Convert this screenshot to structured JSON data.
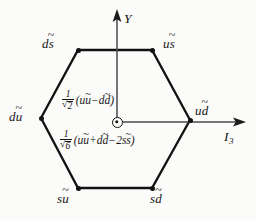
{
  "figure": {
    "background_color": "#fbfbf9",
    "line_color": "#121212"
  },
  "axes": {
    "vertical": {
      "name": "Y",
      "label": "Y",
      "description": "hypercharge axis, arrow up"
    },
    "horizontal": {
      "name": "I3",
      "label": "I",
      "subscript": "3",
      "description": "third isospin component axis, arrow right"
    }
  },
  "origin": {
    "marker": "circled-dot-icon",
    "label": ""
  },
  "vertices": [
    {
      "id": "top-left",
      "label_first": "d",
      "label_second": "s",
      "second_tilde": true,
      "first_tilde": false
    },
    {
      "id": "top-right",
      "label_first": "u",
      "label_second": "s",
      "second_tilde": true,
      "first_tilde": false
    },
    {
      "id": "left",
      "label_first": "d",
      "label_second": "u",
      "second_tilde": true,
      "first_tilde": false
    },
    {
      "id": "right",
      "label_first": "u",
      "label_second": "d",
      "second_tilde": true,
      "first_tilde": false
    },
    {
      "id": "bottom-left",
      "label_first": "s",
      "label_second": "u",
      "second_tilde": true,
      "first_tilde": false
    },
    {
      "id": "bottom-right",
      "label_first": "s",
      "label_second": "d",
      "second_tilde": true,
      "first_tilde": false
    }
  ],
  "center_states": {
    "upper": {
      "coefficient_numerator": "1",
      "coefficient_root": "2",
      "open_paren": "(",
      "term1_q": "u",
      "term1_aq": "u",
      "operator1": "−",
      "term2_q": "d",
      "term2_aq": "d",
      "close_paren": ")"
    },
    "lower": {
      "coefficient_numerator": "1",
      "coefficient_root": "6",
      "open_paren": "(",
      "term1_q": "u",
      "term1_aq": "u",
      "operator1": "+",
      "term2_q": "d",
      "term2_aq": "d",
      "operator2": "−",
      "term3_coeff": "2",
      "term3_q": "s",
      "term3_aq": "s",
      "close_paren": ")"
    }
  }
}
